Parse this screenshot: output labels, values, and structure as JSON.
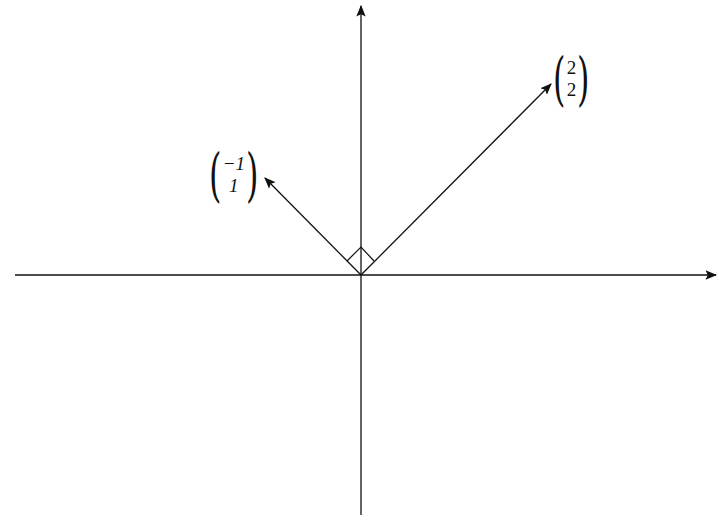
{
  "diagram": {
    "title": "",
    "origin": {
      "x": 361,
      "y": 275
    },
    "axes": {
      "x_axis": {
        "from": [
          15,
          275
        ],
        "to": [
          717,
          275
        ],
        "arrow": "right"
      },
      "y_axis": {
        "from": [
          361,
          515
        ],
        "to": [
          361,
          5
        ],
        "arrow": "up"
      }
    },
    "vectors": [
      {
        "id": "v1",
        "components": [
          "-1",
          "1"
        ],
        "tip": [
          264,
          177
        ],
        "label_top": "−1",
        "label_bottom": "1"
      },
      {
        "id": "v2",
        "components": [
          "2",
          "2"
        ],
        "tip": [
          552,
          83
        ],
        "label_top": "2",
        "label_bottom": "2"
      }
    ],
    "right_angle_marker": {
      "points": [
        [
          361,
          275
        ],
        [
          374,
          261
        ],
        [
          361,
          247
        ],
        [
          347,
          261
        ]
      ]
    },
    "stroke_color": "#111111",
    "background": "#ffffff"
  }
}
